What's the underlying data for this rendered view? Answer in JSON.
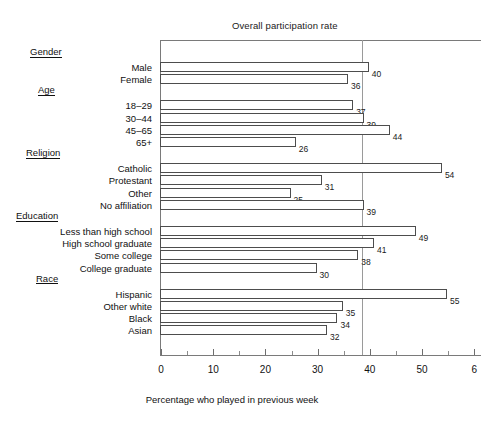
{
  "chart_data": {
    "type": "bar",
    "orientation": "horizontal",
    "title": "",
    "xlabel": "Percentage who played in previous week",
    "ylabel": "",
    "xlim": [
      0,
      60
    ],
    "grid": false,
    "legend": "none",
    "x_ticks": [
      {
        "value": 0,
        "label": "0"
      },
      {
        "value": 10,
        "label": "10"
      },
      {
        "value": 20,
        "label": "20"
      },
      {
        "value": 30,
        "label": "30"
      },
      {
        "value": 40,
        "label": "40"
      },
      {
        "value": 50,
        "label": "50"
      },
      {
        "value": 60,
        "label": "6"
      }
    ],
    "x_minor_ticks": [
      5,
      15,
      25,
      35,
      45,
      55
    ],
    "reference_line": {
      "label": "Overall participation rate",
      "value": 38.5,
      "color": "#9a9a9a"
    },
    "groups": [
      {
        "name": "Gender",
        "categories": [
          "Male",
          "Female"
        ],
        "values": [
          40,
          36
        ]
      },
      {
        "name": "Age",
        "categories": [
          "18–29",
          "30–44",
          "45–65",
          "65+"
        ],
        "values": [
          37,
          39,
          44,
          26
        ]
      },
      {
        "name": "Religion",
        "categories": [
          "Catholic",
          "Protestant",
          "Other",
          "No affiliation"
        ],
        "values": [
          54,
          31,
          25,
          39
        ]
      },
      {
        "name": "Education",
        "categories": [
          "Less than high school",
          "High school graduate",
          "Some college",
          "College graduate"
        ],
        "values": [
          49,
          41,
          38,
          30
        ]
      },
      {
        "name": "Race",
        "categories": [
          "Hispanic",
          "Other white",
          "Black",
          "Asian"
        ],
        "values": [
          55,
          35,
          34,
          32
        ]
      }
    ],
    "categories": [
      "Male",
      "Female",
      "18–29",
      "30–44",
      "45–65",
      "65+",
      "Catholic",
      "Protestant",
      "Other",
      "No affiliation",
      "Less than high school",
      "High school graduate",
      "Some college",
      "College graduate",
      "Hispanic",
      "Other white",
      "Black",
      "Asian"
    ],
    "values": [
      40,
      36,
      37,
      39,
      44,
      26,
      54,
      31,
      25,
      39,
      49,
      41,
      38,
      30,
      55,
      35,
      34,
      32
    ],
    "bar_style": {
      "fill": "#ffffff",
      "edge": "#4d4d4d"
    }
  }
}
